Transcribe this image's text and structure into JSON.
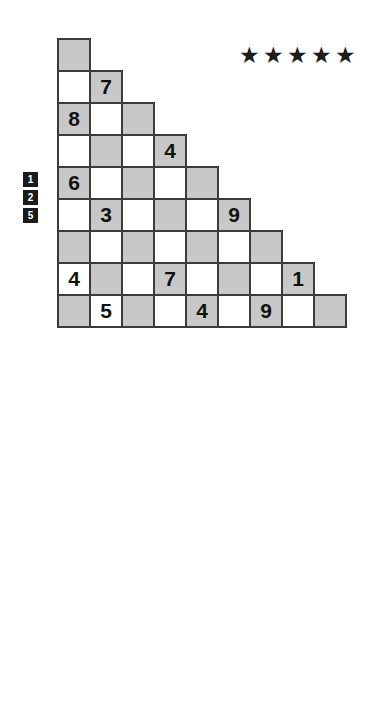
{
  "puzzles": [
    {
      "id": "puzzle-1",
      "difficulty_stars": 5,
      "star_glyph": "★",
      "clues": [
        "1",
        "2",
        "5"
      ],
      "rows": [
        [
          ""
        ],
        [
          "",
          "7"
        ],
        [
          "8",
          "",
          ""
        ],
        [
          "",
          "",
          "",
          "4"
        ],
        [
          "6",
          "",
          "",
          "",
          ""
        ],
        [
          "",
          "3",
          "",
          "",
          "",
          "9"
        ],
        [
          "",
          "",
          "",
          "",
          "",
          "",
          ""
        ],
        [
          "4",
          "",
          "",
          "7",
          "",
          "",
          "",
          "1"
        ],
        [
          "",
          "5",
          "",
          "",
          "4",
          "",
          "9",
          "",
          ""
        ]
      ]
    },
    {
      "id": "puzzle-2",
      "difficulty_stars": 5,
      "star_glyph": "★",
      "clues": [
        "1",
        "2",
        "6"
      ],
      "rows": [
        [
          ""
        ],
        [
          "1",
          ""
        ],
        [
          "",
          "",
          "9"
        ],
        [
          "",
          "3",
          "",
          ""
        ],
        [
          "",
          "",
          "6",
          "",
          ""
        ],
        [
          "5",
          "",
          "",
          "",
          "",
          ""
        ],
        [
          "",
          "",
          "",
          "",
          "7",
          "",
          "1"
        ],
        [
          "2",
          "",
          "",
          "",
          "",
          "4",
          "",
          ""
        ],
        [
          "4",
          "9",
          "",
          "8",
          "",
          "",
          "",
          "3",
          ""
        ]
      ]
    }
  ],
  "colors": {
    "shaded_cell": "#c8c8c8",
    "cell_border": "#3b3b3b",
    "digit": "#111111",
    "clue_box_bg": "#1b1b1b",
    "clue_box_text": "#ffffff",
    "star": "#1b1b1b",
    "background": "#ffffff"
  }
}
